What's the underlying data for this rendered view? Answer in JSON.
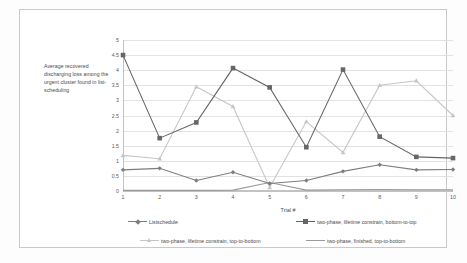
{
  "chart_data": {
    "type": "line",
    "title": "",
    "xlabel": "Trial #",
    "ylabel": "Average recovered discharging loss among the urgent cluster found in list-scheduling",
    "categories": [
      "1",
      "2",
      "3",
      "4",
      "5",
      "6",
      "7",
      "8",
      "9",
      "10"
    ],
    "x": [
      1,
      2,
      3,
      4,
      5,
      6,
      7,
      8,
      9,
      10
    ],
    "xlim": [
      1,
      10
    ],
    "ylim": [
      0,
      5
    ],
    "yticks": [
      "0",
      "0.5",
      "1",
      "1.5",
      "2",
      "2.5",
      "3",
      "3.5",
      "4",
      "4.5",
      "5"
    ],
    "ytick_values": [
      0,
      0.5,
      1,
      1.5,
      2,
      2.5,
      3,
      3.5,
      4,
      4.5,
      5
    ],
    "grid": true,
    "legend_position": "bottom",
    "series": [
      {
        "name": "Listschedule",
        "color": "#7d7d7d",
        "marker": "diamond",
        "values": [
          0.7,
          0.75,
          0.35,
          0.62,
          0.25,
          0.35,
          0.65,
          0.87,
          0.7,
          0.71
        ]
      },
      {
        "name": "two-phase, lifetime constrain, bottom-to-top",
        "color": "#666666",
        "marker": "square",
        "values": [
          4.5,
          1.75,
          2.27,
          4.07,
          3.43,
          1.45,
          4.02,
          1.8,
          1.13,
          1.09
        ]
      },
      {
        "name": "two-phase, lifetime constrain, top-to-bottom",
        "color": "#c6c6c6",
        "marker": "triangle",
        "values": [
          1.18,
          1.07,
          3.45,
          2.8,
          0.12,
          2.3,
          1.28,
          3.5,
          3.65,
          2.5
        ]
      },
      {
        "name": "two-phase, finished, top-to-bottom",
        "color": "#9a9a9a",
        "marker": "none",
        "values": [
          0.02,
          0.02,
          0.02,
          0.03,
          0.28,
          0.03,
          0.04,
          0.05,
          0.04,
          0.04
        ]
      }
    ]
  },
  "legend": {
    "items": [
      {
        "label": "Listschedule"
      },
      {
        "label": "two-phase, lifetime constrain, bottom-to-top"
      },
      {
        "label": "two-phase, lifetime constrain, top-to-bottom"
      },
      {
        "label": "two-phase, finished, top-to-bottom"
      }
    ]
  }
}
